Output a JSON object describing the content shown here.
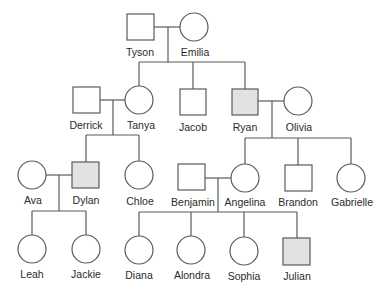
{
  "diagram": {
    "type": "pedigree",
    "legend": {
      "square": "male",
      "circle": "female",
      "shaded": "affected"
    },
    "colors": {
      "stroke": "#5a5a5a",
      "affected_fill": "#e2e2e2",
      "unaffected_fill": "#ffffff"
    },
    "people": [
      {
        "id": "tyson",
        "name": "Tyson",
        "sex": "male",
        "affected": false,
        "generation": 1
      },
      {
        "id": "emilia",
        "name": "Emilia",
        "sex": "female",
        "affected": false,
        "generation": 1
      },
      {
        "id": "derrick",
        "name": "Derrick",
        "sex": "male",
        "affected": false,
        "generation": 2
      },
      {
        "id": "tanya",
        "name": "Tanya",
        "sex": "female",
        "affected": false,
        "generation": 2
      },
      {
        "id": "jacob",
        "name": "Jacob",
        "sex": "male",
        "affected": false,
        "generation": 2
      },
      {
        "id": "ryan",
        "name": "Ryan",
        "sex": "male",
        "affected": true,
        "generation": 2
      },
      {
        "id": "olivia",
        "name": "Olivia",
        "sex": "female",
        "affected": false,
        "generation": 2
      },
      {
        "id": "ava",
        "name": "Ava",
        "sex": "female",
        "affected": false,
        "generation": 3
      },
      {
        "id": "dylan",
        "name": "Dylan",
        "sex": "male",
        "affected": true,
        "generation": 3
      },
      {
        "id": "chloe",
        "name": "Chloe",
        "sex": "female",
        "affected": false,
        "generation": 3
      },
      {
        "id": "benjamin",
        "name": "Benjamin",
        "sex": "male",
        "affected": false,
        "generation": 3
      },
      {
        "id": "angelina",
        "name": "Angelina",
        "sex": "female",
        "affected": false,
        "generation": 3
      },
      {
        "id": "brandon",
        "name": "Brandon",
        "sex": "male",
        "affected": false,
        "generation": 3
      },
      {
        "id": "gabrielle",
        "name": "Gabrielle",
        "sex": "female",
        "affected": false,
        "generation": 3
      },
      {
        "id": "leah",
        "name": "Leah",
        "sex": "female",
        "affected": false,
        "generation": 4
      },
      {
        "id": "jackie",
        "name": "Jackie",
        "sex": "female",
        "affected": false,
        "generation": 4
      },
      {
        "id": "diana",
        "name": "Diana",
        "sex": "female",
        "affected": false,
        "generation": 4
      },
      {
        "id": "alondra",
        "name": "Alondra",
        "sex": "female",
        "affected": false,
        "generation": 4
      },
      {
        "id": "sophia",
        "name": "Sophia",
        "sex": "female",
        "affected": false,
        "generation": 4
      },
      {
        "id": "julian",
        "name": "Julian",
        "sex": "male",
        "affected": true,
        "generation": 4
      }
    ],
    "couples": [
      {
        "partners": [
          "Tyson",
          "Emilia"
        ],
        "children": [
          "Tanya",
          "Jacob",
          "Ryan"
        ]
      },
      {
        "partners": [
          "Derrick",
          "Tanya"
        ],
        "children": [
          "Dylan",
          "Chloe"
        ]
      },
      {
        "partners": [
          "Ryan",
          "Olivia"
        ],
        "children": [
          "Angelina",
          "Brandon",
          "Gabrielle"
        ]
      },
      {
        "partners": [
          "Ava",
          "Dylan"
        ],
        "children": [
          "Leah",
          "Jackie"
        ]
      },
      {
        "partners": [
          "Benjamin",
          "Angelina"
        ],
        "children": [
          "Diana",
          "Alondra",
          "Sophia",
          "Julian"
        ]
      }
    ]
  },
  "labels": {
    "tyson": "Tyson",
    "emilia": "Emilia",
    "derrick": "Derrick",
    "tanya": "Tanya",
    "jacob": "Jacob",
    "ryan": "Ryan",
    "olivia": "Olivia",
    "ava": "Ava",
    "dylan": "Dylan",
    "chloe": "Chloe",
    "benjamin": "Benjamin",
    "angelina": "Angelina",
    "brandon": "Brandon",
    "gabrielle": "Gabrielle",
    "leah": "Leah",
    "jackie": "Jackie",
    "diana": "Diana",
    "alondra": "Alondra",
    "sophia": "Sophia",
    "julian": "Julian"
  }
}
